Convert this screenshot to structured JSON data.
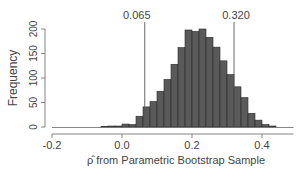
{
  "chart_data": {
    "type": "bar",
    "title": "",
    "xlabel": "ρ̂  from Parametric Bootstrap Sample",
    "ylabel": "Frequency",
    "xlim": [
      -0.2,
      0.5
    ],
    "ylim": [
      0,
      200
    ],
    "x_ticks": [
      -0.2,
      0.0,
      0.2,
      0.4
    ],
    "x_tick_labels": [
      "-0.2",
      "0.0",
      "0.2",
      "0.4"
    ],
    "y_ticks": [
      0,
      50,
      100,
      150,
      200
    ],
    "y_tick_labels": [
      "0",
      "50",
      "100",
      "150",
      "200"
    ],
    "bin_width": 0.02,
    "bin_left_edges": [
      -0.06,
      -0.04,
      -0.02,
      0.0,
      0.02,
      0.04,
      0.06,
      0.08,
      0.1,
      0.12,
      0.14,
      0.16,
      0.18,
      0.2,
      0.22,
      0.24,
      0.26,
      0.28,
      0.3,
      0.32,
      0.34,
      0.36,
      0.38,
      0.4,
      0.42
    ],
    "values": [
      1,
      2,
      2,
      6,
      5,
      22,
      41,
      52,
      73,
      97,
      128,
      162,
      198,
      195,
      200,
      183,
      163,
      135,
      107,
      82,
      60,
      28,
      14,
      5,
      2
    ],
    "bar_color": "#5a5a5a",
    "annotations": [
      {
        "type": "vline",
        "x": 0.065,
        "label": "0.065"
      },
      {
        "type": "vline",
        "x": 0.32,
        "label": "0.320"
      }
    ],
    "grid": false,
    "legend": null
  }
}
